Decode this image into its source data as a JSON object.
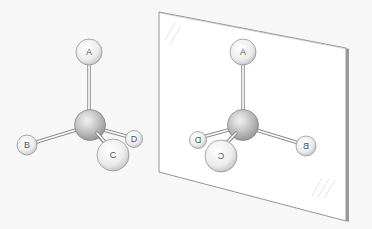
{
  "diagram": {
    "title": "",
    "original_molecule": {
      "center_atom": "",
      "substituents": [
        {
          "id": "A",
          "label": "A",
          "position": "top"
        },
        {
          "id": "B",
          "label": "B",
          "position": "left"
        },
        {
          "id": "C",
          "label": "C",
          "position": "front-bottom"
        },
        {
          "id": "D",
          "label": "D",
          "position": "right-back"
        }
      ]
    },
    "mirror_image": {
      "substituents": [
        {
          "id": "A",
          "label": "A",
          "position": "top"
        },
        {
          "id": "B",
          "label": "B",
          "position": "right",
          "mirrored": true
        },
        {
          "id": "C",
          "label": "C",
          "position": "front-bottom",
          "mirrored": true
        },
        {
          "id": "D",
          "label": "D",
          "position": "left-back",
          "mirrored": true
        }
      ]
    },
    "colors": {
      "background": "#f7f7f7",
      "mirror": "#ffffff",
      "mirror_edge": "#888888",
      "atom_fill": "#eeeeee",
      "center_fill": "#bdbdbd",
      "bond": "#999999"
    }
  }
}
